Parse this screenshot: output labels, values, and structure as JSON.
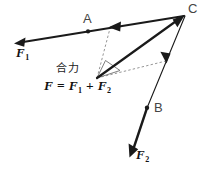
{
  "figure": {
    "width": 205,
    "height": 169,
    "background_color": "#ffffff",
    "stroke_color": "#1a1a1a",
    "dashed_color": "#777777"
  },
  "labels": {
    "point_a": "A",
    "point_b": "B",
    "point_c": "C",
    "vector_f1": "F",
    "vector_f1_sub": "1",
    "vector_f2": "F",
    "vector_f2_sub": "2",
    "resultant_word": "合力",
    "equation": {
      "lhs": "F",
      "equals": "=",
      "term1": "F",
      "term1_sub": "1",
      "plus": "+",
      "term2": "F",
      "term2_sub": "2"
    }
  },
  "geometry": {
    "origin": [
      97,
      78
    ],
    "point_a": [
      88,
      31
    ],
    "point_b": [
      147,
      108
    ],
    "point_c": [
      185,
      15
    ],
    "f1_tip": [
      15,
      43
    ],
    "f2_tip": [
      130,
      156
    ],
    "dashed_join_top": [
      110,
      27
    ],
    "dashed_arrow_right": [
      166,
      62
    ]
  }
}
